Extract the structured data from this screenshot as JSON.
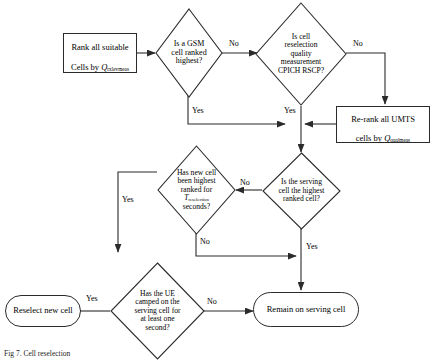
{
  "figure": {
    "type": "flowchart",
    "caption": "Fig 7.  Cell reselection",
    "font_note": "serif"
  },
  "nodes": {
    "rank_all": {
      "id": "rank-all-suitable-cells",
      "shape": "rect",
      "line1": "Rank all suitable",
      "line2_pre": "Cells by ",
      "line2_sym": "Q",
      "line2_sub": "rxlevmeas"
    },
    "gsm_ranked": {
      "id": "is-gsm-cell-ranked-highest",
      "shape": "diamond",
      "text": "Is a GSM\ncell ranked\nhighest?"
    },
    "cpich": {
      "id": "is-cell-reselection-quality-cpich-rscp",
      "shape": "diamond",
      "text": "Is cell\nreselection\nquality\nmeasurement\nCPICH RSCP?"
    },
    "rerank": {
      "id": "re-rank-all-umts-cells",
      "shape": "rect",
      "line1": "Re-rank all UMTS",
      "line2_pre": "cells by ",
      "line2_sym": "Q",
      "line2_sub": "qualmeas"
    },
    "new_cell_highest": {
      "id": "has-new-cell-been-highest-ranked",
      "shape": "diamond",
      "l1": "Has new cell",
      "l2": "been highest",
      "l3": "ranked for",
      "l4_sym": "T",
      "l4_sub": "reselection",
      "l5": "seconds?"
    },
    "serving_highest": {
      "id": "is-serving-cell-highest-ranked",
      "shape": "diamond",
      "text": "Is the serving\ncell the highest\nranked cell?"
    },
    "ue_camped": {
      "id": "has-ue-camped-one-second",
      "shape": "diamond",
      "text": "Has the UE\ncamped on the\nserving cell for\nat least one\nsecond?"
    },
    "reselect": {
      "id": "reselect-new-cell",
      "shape": "rounded",
      "text": "Reselect new cell"
    },
    "remain": {
      "id": "remain-on-serving-cell",
      "shape": "rounded",
      "text": "Remain on serving cell"
    }
  },
  "edges": [
    {
      "name": "rank-to-gsm",
      "label": ""
    },
    {
      "name": "gsm-no-to-cpich",
      "label": "No"
    },
    {
      "name": "gsm-yes-down",
      "label": "Yes"
    },
    {
      "name": "cpich-no-to-rerank",
      "label": "No"
    },
    {
      "name": "cpich-yes-down",
      "label": "Yes"
    },
    {
      "name": "rerank-to-junction",
      "label": ""
    },
    {
      "name": "junction-to-serving",
      "label": ""
    },
    {
      "name": "serving-no-to-newcell",
      "label": "No"
    },
    {
      "name": "serving-yes-to-remain",
      "label": "Yes"
    },
    {
      "name": "newcell-yes-to-uecamped",
      "label": "Yes"
    },
    {
      "name": "newcell-no-to-remain",
      "label": "No"
    },
    {
      "name": "uecamped-yes-to-reselect",
      "label": "Yes"
    },
    {
      "name": "uecamped-no-to-remain",
      "label": "No"
    }
  ],
  "edge_labels": {
    "gsm_no": "No",
    "gsm_yes": "Yes",
    "cpich_no": "No",
    "cpich_yes": "Yes",
    "serving_no": "No",
    "serving_yes": "Yes",
    "newcell_yes": "Yes",
    "newcell_no": "No",
    "ue_yes": "Yes",
    "ue_no": "No"
  },
  "style": {
    "stroke": "#2b2b2b",
    "background": "#ffffff",
    "text": "#000000"
  }
}
